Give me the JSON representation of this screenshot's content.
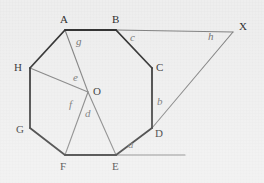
{
  "figure": {
    "background_color": "#eeeeee",
    "outline_color": "#2b2b2b",
    "construction_color": "#7d7d7d",
    "vertex_label_color": "#2b2b2b",
    "angle_label_color": "#6f6f6f"
  },
  "vertices": [
    {
      "name": "A",
      "label": "A",
      "x": 65,
      "y": 30,
      "label_x": 60,
      "label_y": 14
    },
    {
      "name": "B",
      "label": "B",
      "x": 116,
      "y": 30,
      "label_x": 112,
      "label_y": 14
    },
    {
      "name": "C",
      "label": "C",
      "x": 152,
      "y": 68,
      "label_x": 156,
      "label_y": 62
    },
    {
      "name": "D",
      "label": "D",
      "x": 152,
      "y": 128,
      "label_x": 155,
      "label_y": 128
    },
    {
      "name": "E",
      "label": "E",
      "x": 116,
      "y": 155,
      "label_x": 112,
      "label_y": 161
    },
    {
      "name": "F",
      "label": "F",
      "x": 65,
      "y": 155,
      "label_x": 60,
      "label_y": 161
    },
    {
      "name": "G",
      "label": "G",
      "x": 30,
      "y": 128,
      "label_x": 16,
      "label_y": 124
    },
    {
      "name": "H",
      "label": "H",
      "x": 30,
      "y": 68,
      "label_x": 14,
      "label_y": 62
    }
  ],
  "points": [
    {
      "name": "O",
      "label": "O",
      "x": 88,
      "y": 92,
      "label_x": 93,
      "label_y": 86
    },
    {
      "name": "X",
      "label": "X",
      "x": 233,
      "y": 32,
      "label_x": 239,
      "label_y": 21
    }
  ],
  "octagon_edges": [
    [
      "A",
      "B"
    ],
    [
      "B",
      "C"
    ],
    [
      "C",
      "D"
    ],
    [
      "D",
      "E"
    ],
    [
      "E",
      "F"
    ],
    [
      "F",
      "G"
    ],
    [
      "G",
      "H"
    ],
    [
      "H",
      "A"
    ]
  ],
  "construction_lines": [
    {
      "name": "radius-OA",
      "from": "O",
      "to": "A"
    },
    {
      "name": "radius-OH",
      "from": "O",
      "to": "H"
    },
    {
      "name": "radius-OF",
      "from": "O",
      "to": "F"
    },
    {
      "name": "radius-OE",
      "from": "O",
      "to": "E"
    },
    {
      "name": "extension-BX",
      "from": "B",
      "to": "X"
    },
    {
      "name": "extension-DX",
      "from": "D",
      "to": "X"
    },
    {
      "name": "extension-E-ray",
      "from_x": 116,
      "from_y": 155,
      "to_x": 185,
      "to_y": 155
    }
  ],
  "angle_labels": [
    {
      "name": "angle-a",
      "label": "a",
      "x": 128,
      "y": 139,
      "desc": "exterior angle at E"
    },
    {
      "name": "angle-b",
      "label": "b",
      "x": 157,
      "y": 96,
      "desc": "angle CDX at D"
    },
    {
      "name": "angle-c",
      "label": "c",
      "x": 130,
      "y": 32,
      "desc": "angle XBC at B"
    },
    {
      "name": "angle-d",
      "label": "d",
      "x": 85,
      "y": 108,
      "desc": "angle FOE at O"
    },
    {
      "name": "angle-e",
      "label": "e",
      "x": 73,
      "y": 72,
      "desc": "angle HOA at O"
    },
    {
      "name": "angle-f",
      "label": "f",
      "x": 69,
      "y": 99,
      "desc": "angle HOF at O"
    },
    {
      "name": "angle-g",
      "label": "g",
      "x": 76,
      "y": 36,
      "desc": "angle OAB at A"
    },
    {
      "name": "angle-h",
      "label": "h",
      "x": 208,
      "y": 31,
      "desc": "angle BXD at X"
    }
  ]
}
